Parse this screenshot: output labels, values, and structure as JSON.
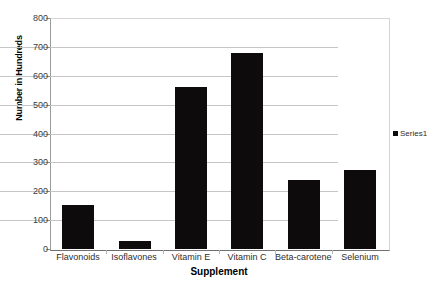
{
  "chart_data": {
    "type": "bar",
    "title": "",
    "xlabel": "Supplement",
    "ylabel": "Number in Hundreds",
    "categories": [
      "Flavonoids",
      "Isoflavones",
      "Vitamin E",
      "Vitamin C",
      "Beta-carotene",
      "Selenium"
    ],
    "values": [
      153,
      28,
      560,
      680,
      238,
      273
    ],
    "series": [
      {
        "name": "Series1",
        "values": [
          153,
          28,
          560,
          680,
          238,
          273
        ]
      }
    ],
    "ylim": [
      0,
      800
    ],
    "ytick_labels": [
      "0",
      "100",
      "200",
      "300",
      "400",
      "500",
      "600",
      "700",
      "800"
    ],
    "ytick_values": [
      0,
      100,
      200,
      300,
      400,
      500,
      600,
      700,
      800
    ],
    "grid": true,
    "legend_position": "right",
    "bar_color": "#0d0b0b",
    "gridline_color": "#c6c6c6",
    "background_color": "#ffffff"
  },
  "legend": {
    "entries": [
      {
        "label": "Series1",
        "swatch_name": "legend-swatch-series1"
      }
    ]
  },
  "axes": {
    "x_title": "Supplement",
    "y_title": "Number in Hundreds"
  }
}
